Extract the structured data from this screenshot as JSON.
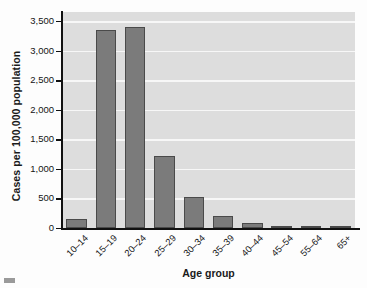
{
  "chart_data": {
    "type": "bar",
    "title": "",
    "xlabel": "Age group",
    "ylabel": "Cases per 100,000 population",
    "categories": [
      "10–14",
      "15–19",
      "20–24",
      "25–29",
      "30–34",
      "35–39",
      "40–44",
      "45–54",
      "55–64",
      "65+"
    ],
    "values": [
      150,
      3350,
      3400,
      1225,
      520,
      200,
      85,
      35,
      12,
      3
    ],
    "ylim": [
      0,
      3500
    ],
    "yticks": [
      0,
      500,
      1000,
      1500,
      2000,
      2500,
      3000,
      3500
    ],
    "ytick_labels": [
      "0",
      "500",
      "1,000",
      "1,500",
      "2,000",
      "2,500",
      "3,000",
      "3,500"
    ],
    "grid": true,
    "legend": false,
    "colors": {
      "bar_fill": "#7b7b7b",
      "bar_edge": "#4a4a4a",
      "plot_background": "#dddddd",
      "gridline": "#f7f7f7",
      "axis": "#111111",
      "text": "#141414"
    }
  }
}
